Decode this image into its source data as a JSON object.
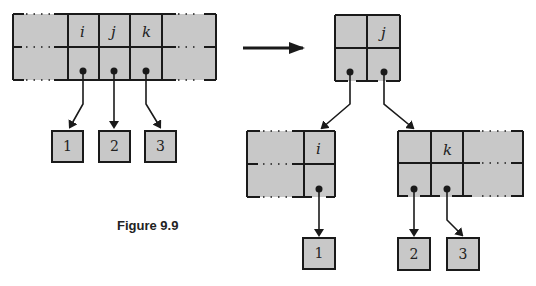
{
  "figure": {
    "caption": "Figure 9.9"
  },
  "before": {
    "node_keys": [
      "i",
      "j",
      "k"
    ],
    "children": [
      "1",
      "2",
      "3"
    ]
  },
  "after": {
    "parent_keys": [
      "j"
    ],
    "left_child": {
      "keys": [
        "i"
      ],
      "children": [
        "1"
      ]
    },
    "right_child": {
      "keys": [
        "k"
      ],
      "children": [
        "2",
        "3"
      ]
    }
  },
  "icons": {
    "transform_arrow": "right-arrow-icon"
  },
  "colors": {
    "node_fill": "#c8c8c8",
    "stroke": "#1a1a1a",
    "background": "#ffffff"
  }
}
